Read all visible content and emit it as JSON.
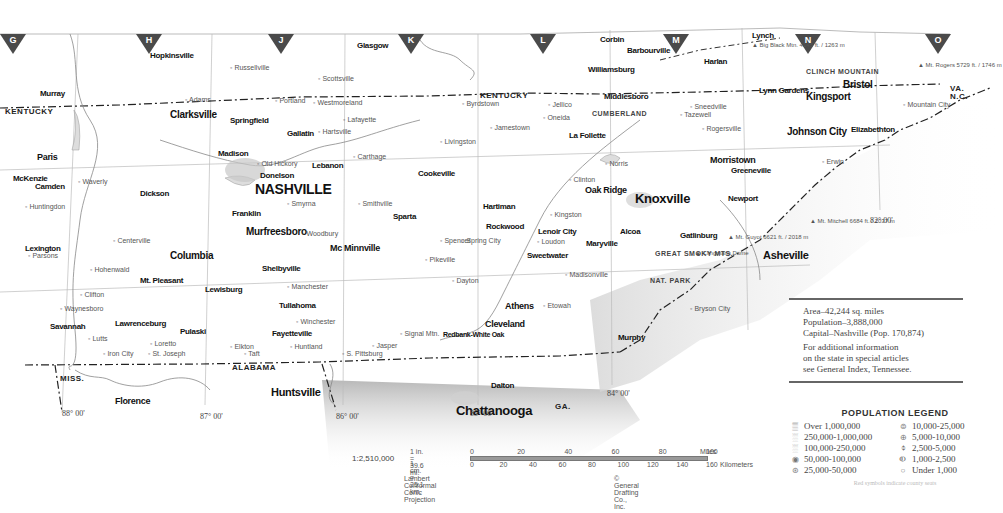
{
  "map": {
    "title": "Tennessee",
    "grid_letters": [
      {
        "letter": "G",
        "x": 0
      },
      {
        "letter": "H",
        "x": 136
      },
      {
        "letter": "J",
        "x": 268
      },
      {
        "letter": "K",
        "x": 398
      },
      {
        "letter": "L",
        "x": 530
      },
      {
        "letter": "M",
        "x": 663
      },
      {
        "letter": "N",
        "x": 795
      },
      {
        "letter": "O",
        "x": 925
      }
    ],
    "state_labels": [
      {
        "text": "KENTUCKY",
        "x": 5,
        "y": 108
      },
      {
        "text": "KENTUCKY",
        "x": 480,
        "y": 92
      },
      {
        "text": "VA.",
        "x": 950,
        "y": 85
      },
      {
        "text": "N.C.",
        "x": 950,
        "y": 93
      },
      {
        "text": "ALABAMA",
        "x": 232,
        "y": 364
      },
      {
        "text": "GA.",
        "x": 555,
        "y": 403
      },
      {
        "text": "MISS.",
        "x": 60,
        "y": 375
      }
    ],
    "major_cities": [
      {
        "name": "NASHVILLE",
        "x": 255,
        "y": 182,
        "size": 14
      },
      {
        "name": "Knoxville",
        "x": 635,
        "y": 192,
        "size": 13
      },
      {
        "name": "Chattanooga",
        "x": 456,
        "y": 404,
        "size": 13
      },
      {
        "name": "Clarksville",
        "x": 170,
        "y": 110,
        "size": 10
      },
      {
        "name": "Murfreesboro",
        "x": 246,
        "y": 227,
        "size": 10
      },
      {
        "name": "Columbia",
        "x": 170,
        "y": 251,
        "size": 10
      },
      {
        "name": "Johnson City",
        "x": 787,
        "y": 127,
        "size": 10
      },
      {
        "name": "Kingsport",
        "x": 806,
        "y": 92,
        "size": 10
      },
      {
        "name": "Bristol",
        "x": 843,
        "y": 80,
        "size": 10
      },
      {
        "name": "Huntsville",
        "x": 271,
        "y": 387,
        "size": 11
      },
      {
        "name": "Asheville",
        "x": 763,
        "y": 250,
        "size": 11
      },
      {
        "name": "Florence",
        "x": 115,
        "y": 397,
        "size": 9
      },
      {
        "name": "Cleveland",
        "x": 485,
        "y": 320,
        "size": 9
      },
      {
        "name": "Athens",
        "x": 505,
        "y": 302,
        "size": 9
      },
      {
        "name": "Morristown",
        "x": 710,
        "y": 156,
        "size": 9
      },
      {
        "name": "Oak Ridge",
        "x": 585,
        "y": 186,
        "size": 9
      },
      {
        "name": "Mc Minnville",
        "x": 330,
        "y": 244,
        "size": 9
      },
      {
        "name": "Hopkinsville",
        "x": 150,
        "y": 52,
        "size": 8
      },
      {
        "name": "Glasgow",
        "x": 357,
        "y": 42,
        "size": 8
      },
      {
        "name": "Corbin",
        "x": 600,
        "y": 36,
        "size": 8
      },
      {
        "name": "Barbourville",
        "x": 627,
        "y": 47,
        "size": 8
      },
      {
        "name": "Lynch",
        "x": 752,
        "y": 32,
        "size": 8
      },
      {
        "name": "Harlan",
        "x": 704,
        "y": 58,
        "size": 8
      },
      {
        "name": "Middlesboro",
        "x": 604,
        "y": 93,
        "size": 8
      },
      {
        "name": "Williamsburg",
        "x": 588,
        "y": 66,
        "size": 8
      },
      {
        "name": "Lynn Gardens",
        "x": 759,
        "y": 87,
        "size": 8
      },
      {
        "name": "Elizabethton",
        "x": 851,
        "y": 126,
        "size": 8
      },
      {
        "name": "Murray",
        "x": 40,
        "y": 90,
        "size": 8
      },
      {
        "name": "Paris",
        "x": 37,
        "y": 153,
        "size": 9
      },
      {
        "name": "McKenzie",
        "x": 13,
        "y": 175,
        "size": 8
      },
      {
        "name": "Camden",
        "x": 35,
        "y": 183,
        "size": 8
      },
      {
        "name": "Dickson",
        "x": 140,
        "y": 190,
        "size": 8
      },
      {
        "name": "Lexington",
        "x": 25,
        "y": 245,
        "size": 8
      },
      {
        "name": "Savannah",
        "x": 50,
        "y": 323,
        "size": 8
      },
      {
        "name": "Lawrenceburg",
        "x": 115,
        "y": 320,
        "size": 8
      },
      {
        "name": "Pulaski",
        "x": 180,
        "y": 328,
        "size": 8
      },
      {
        "name": "Lewisburg",
        "x": 205,
        "y": 286,
        "size": 8
      },
      {
        "name": "Shelbyville",
        "x": 262,
        "y": 265,
        "size": 8
      },
      {
        "name": "Tullahoma",
        "x": 279,
        "y": 302,
        "size": 8
      },
      {
        "name": "Fayetteville",
        "x": 272,
        "y": 330,
        "size": 8
      },
      {
        "name": "Mt. Pleasant",
        "x": 140,
        "y": 277,
        "size": 8
      },
      {
        "name": "Franklin",
        "x": 232,
        "y": 210,
        "size": 8
      },
      {
        "name": "Springfield",
        "x": 230,
        "y": 117,
        "size": 8
      },
      {
        "name": "Gallatin",
        "x": 287,
        "y": 130,
        "size": 8
      },
      {
        "name": "Madison",
        "x": 218,
        "y": 150,
        "size": 8
      },
      {
        "name": "Donelson",
        "x": 260,
        "y": 172,
        "size": 8
      },
      {
        "name": "Lebanon",
        "x": 312,
        "y": 162,
        "size": 8
      },
      {
        "name": "Cookeville",
        "x": 418,
        "y": 170,
        "size": 8
      },
      {
        "name": "Sparta",
        "x": 393,
        "y": 213,
        "size": 8
      },
      {
        "name": "Rockwood",
        "x": 486,
        "y": 223,
        "size": 8
      },
      {
        "name": "Lenoir City",
        "x": 538,
        "y": 228,
        "size": 8
      },
      {
        "name": "Maryville",
        "x": 586,
        "y": 240,
        "size": 8
      },
      {
        "name": "Alcoa",
        "x": 620,
        "y": 228,
        "size": 8
      },
      {
        "name": "Gatlinburg",
        "x": 680,
        "y": 232,
        "size": 8
      },
      {
        "name": "Greeneville",
        "x": 731,
        "y": 167,
        "size": 8
      },
      {
        "name": "Newport",
        "x": 728,
        "y": 195,
        "size": 8
      },
      {
        "name": "La Follette",
        "x": 569,
        "y": 132,
        "size": 8
      },
      {
        "name": "Murphy",
        "x": 618,
        "y": 334,
        "size": 8
      },
      {
        "name": "Dalton",
        "x": 491,
        "y": 382,
        "size": 8
      },
      {
        "name": "Hartiman",
        "x": 483,
        "y": 203,
        "size": 8
      },
      {
        "name": "Sweetwater",
        "x": 527,
        "y": 252,
        "size": 8
      },
      {
        "name": "Redbank-White Oak",
        "x": 443,
        "y": 331,
        "size": 7
      }
    ],
    "minor_places": [
      {
        "name": "Russellville",
        "x": 230,
        "y": 64
      },
      {
        "name": "Scottsville",
        "x": 318,
        "y": 75
      },
      {
        "name": "Adams",
        "x": 185,
        "y": 96
      },
      {
        "name": "Portland",
        "x": 275,
        "y": 97
      },
      {
        "name": "Westmoreland",
        "x": 313,
        "y": 99
      },
      {
        "name": "Lafayette",
        "x": 343,
        "y": 116
      },
      {
        "name": "Hartsville",
        "x": 318,
        "y": 128
      },
      {
        "name": "Old Hickory",
        "x": 257,
        "y": 160
      },
      {
        "name": "Carthage",
        "x": 353,
        "y": 153
      },
      {
        "name": "Livingston",
        "x": 440,
        "y": 138
      },
      {
        "name": "Jamestown",
        "x": 490,
        "y": 124
      },
      {
        "name": "Byrdstown",
        "x": 462,
        "y": 100
      },
      {
        "name": "Oneida",
        "x": 543,
        "y": 114
      },
      {
        "name": "Jellico",
        "x": 548,
        "y": 101
      },
      {
        "name": "Clinton",
        "x": 569,
        "y": 176
      },
      {
        "name": "Norris",
        "x": 605,
        "y": 160
      },
      {
        "name": "Tazewell",
        "x": 680,
        "y": 111
      },
      {
        "name": "Rogersville",
        "x": 702,
        "y": 125
      },
      {
        "name": "Sneedville",
        "x": 690,
        "y": 103
      },
      {
        "name": "Erwin",
        "x": 822,
        "y": 158
      },
      {
        "name": "Mountain City",
        "x": 903,
        "y": 101
      },
      {
        "name": "Smithville",
        "x": 358,
        "y": 200
      },
      {
        "name": "Smyrna",
        "x": 287,
        "y": 200
      },
      {
        "name": "Woodbury",
        "x": 302,
        "y": 230
      },
      {
        "name": "Manchester",
        "x": 287,
        "y": 283
      },
      {
        "name": "Winchester",
        "x": 296,
        "y": 318
      },
      {
        "name": "Signal Mtn.",
        "x": 400,
        "y": 330
      },
      {
        "name": "Jasper",
        "x": 372,
        "y": 342
      },
      {
        "name": "S. Pittsburg",
        "x": 342,
        "y": 350
      },
      {
        "name": "Spencer",
        "x": 440,
        "y": 237
      },
      {
        "name": "Spring City",
        "x": 462,
        "y": 237
      },
      {
        "name": "Dayton",
        "x": 452,
        "y": 277
      },
      {
        "name": "Pikeville",
        "x": 425,
        "y": 256
      },
      {
        "name": "Loudon",
        "x": 537,
        "y": 238
      },
      {
        "name": "Kingston",
        "x": 550,
        "y": 211
      },
      {
        "name": "Madisonville",
        "x": 565,
        "y": 271
      },
      {
        "name": "Etowah",
        "x": 543,
        "y": 302
      },
      {
        "name": "Bryson City",
        "x": 690,
        "y": 305
      },
      {
        "name": "Waverly",
        "x": 78,
        "y": 178
      },
      {
        "name": "Huntingdon",
        "x": 25,
        "y": 203
      },
      {
        "name": "Parsons",
        "x": 28,
        "y": 252
      },
      {
        "name": "Waynesboro",
        "x": 60,
        "y": 305
      },
      {
        "name": "Hohenwald",
        "x": 90,
        "y": 266
      },
      {
        "name": "Centerville",
        "x": 113,
        "y": 237
      },
      {
        "name": "Clifton",
        "x": 80,
        "y": 291
      },
      {
        "name": "Lutts",
        "x": 88,
        "y": 335
      },
      {
        "name": "Loretto",
        "x": 150,
        "y": 340
      },
      {
        "name": "Iron City",
        "x": 103,
        "y": 350
      },
      {
        "name": "St. Joseph",
        "x": 148,
        "y": 350
      },
      {
        "name": "Elkton",
        "x": 230,
        "y": 343
      },
      {
        "name": "Taft",
        "x": 244,
        "y": 350
      },
      {
        "name": "Huntland",
        "x": 290,
        "y": 343
      }
    ],
    "meridians": [
      {
        "label": "88° 00'",
        "x": 62,
        "y": 410
      },
      {
        "label": "87° 00'",
        "x": 200,
        "y": 413
      },
      {
        "label": "86° 00'",
        "x": 336,
        "y": 413
      },
      {
        "label": "85° 00'",
        "x": 470,
        "y": 410
      },
      {
        "label": "84° 00'",
        "x": 607,
        "y": 390
      },
      {
        "label": "82° 00'",
        "x": 870,
        "y": 217
      }
    ],
    "peaks": [
      {
        "name": "Big Black Mtn.",
        "elev": "4145 ft. / 1263 m",
        "x": 752,
        "y": 42
      },
      {
        "name": "Mt. Rogers",
        "elev": "5729 ft. / 1746 m",
        "x": 918,
        "y": 62
      },
      {
        "name": "Mt. Mitchell",
        "elev": "6684 ft. / 2037 m",
        "x": 810,
        "y": 218
      },
      {
        "name": "Mt. Guyot",
        "elev": "6621 ft. / 2018 m",
        "x": 728,
        "y": 234
      },
      {
        "name": "Clingmans Dome",
        "x": 695,
        "y": 250
      }
    ],
    "features": [
      {
        "name": "GREAT SMOKY MTS.",
        "x": 655,
        "y": 250
      },
      {
        "name": "NAT. PARK",
        "x": 650,
        "y": 277
      },
      {
        "name": "CUMBERLAND",
        "x": 592,
        "y": 110
      },
      {
        "name": "CLINCH MOUNTAIN",
        "x": 806,
        "y": 68
      }
    ]
  },
  "info_box": {
    "area": "Area–42,244 sq. miles",
    "population": "Population–3,888,000",
    "capital": "Capital–Nashville (Pop. 170,874)",
    "note_1": "For additional information",
    "note_2": "on the state in special articles",
    "note_3": "see General Index, Tennessee."
  },
  "legend": {
    "title": "POPULATION LEGEND",
    "left": [
      {
        "symbol": "▒",
        "label": "Over 1,000,000"
      },
      {
        "symbol": "░",
        "label": "250,000-1,000,000"
      },
      {
        "symbol": "░",
        "label": "100,000-250,000"
      },
      {
        "symbol": "◉",
        "label": "50,000-100,000"
      },
      {
        "symbol": "⊛",
        "label": "25,000-50,000"
      }
    ],
    "right": [
      {
        "symbol": "⊜",
        "label": "10,000-25,000"
      },
      {
        "symbol": "⊕",
        "label": "5,000-10,000"
      },
      {
        "symbol": "⌽",
        "label": "2,500-5,000"
      },
      {
        "symbol": "⦶",
        "label": "1,000-2,500"
      },
      {
        "symbol": "○",
        "label": "Under 1,000"
      }
    ],
    "note": "Red symbols indicate county seats"
  },
  "scale": {
    "ratio": "1:2,510,000",
    "inch": "1 in. = 39.6 mi.",
    "cm": "1 cm. = 25.1 km.",
    "miles_ticks": [
      "0",
      "20",
      "40",
      "60",
      "80",
      "100"
    ],
    "miles_label": "Miles",
    "km_ticks": [
      "0",
      "20",
      "40",
      "60",
      "80",
      "100",
      "120",
      "140",
      "160"
    ],
    "km_label": "Kilometers",
    "projection": "Lambert Conformal Conic Projection",
    "copyright": "© General Drafting Co., Inc."
  }
}
